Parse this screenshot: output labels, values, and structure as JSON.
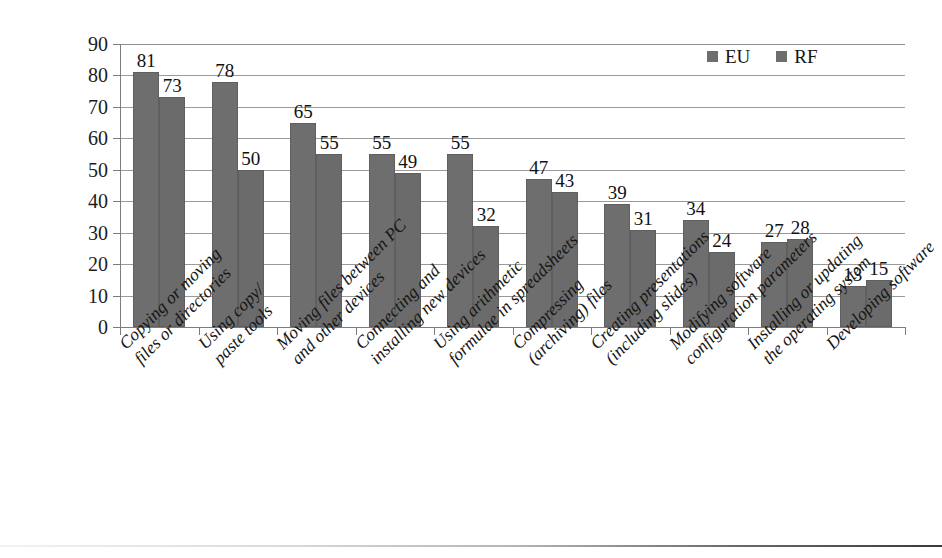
{
  "chart_data": {
    "type": "bar",
    "title": "",
    "xlabel": "",
    "ylabel": "",
    "ylim": [
      0,
      90
    ],
    "yticks": [
      0,
      10,
      20,
      30,
      40,
      50,
      60,
      70,
      80,
      90
    ],
    "grid": true,
    "legend_position": "top-right",
    "categories": [
      "Copying or moving files or directories",
      "Using copy/ paste tools",
      "Moving files between PC and other devices",
      "Connecting and installing new devices",
      "Using arithmetic formulae in spreadsheets",
      "Compressing (archiving) files",
      "Creating presentations (including slides)",
      "Modifying software configuration parameters",
      "Installing or updating the operating system",
      "Developing software"
    ],
    "category_lines": [
      [
        "Copying or moving",
        "files or directories"
      ],
      [
        "Using copy/",
        "paste tools"
      ],
      [
        "Moving files between PC",
        "and other devices"
      ],
      [
        "Connecting and",
        "installing new devices"
      ],
      [
        "Using arithmetic",
        "formulae in spreadsheets"
      ],
      [
        "Compressing",
        "(archiving) files"
      ],
      [
        "Creating presentations",
        "(including slides)"
      ],
      [
        "Modifying software",
        "configuration parameters"
      ],
      [
        "Installing or updating",
        "the operating system"
      ],
      [
        "Developing software",
        ""
      ]
    ],
    "series": [
      {
        "name": "EU",
        "color": "#6e6e6e",
        "values": [
          81,
          78,
          65,
          55,
          55,
          47,
          39,
          34,
          27,
          13
        ]
      },
      {
        "name": "RF",
        "color": "#6b6b6b",
        "values": [
          73,
          50,
          55,
          49,
          32,
          43,
          31,
          24,
          28,
          15
        ]
      }
    ]
  },
  "legend": {
    "items": [
      {
        "label": "EU"
      },
      {
        "label": "RF"
      }
    ]
  }
}
